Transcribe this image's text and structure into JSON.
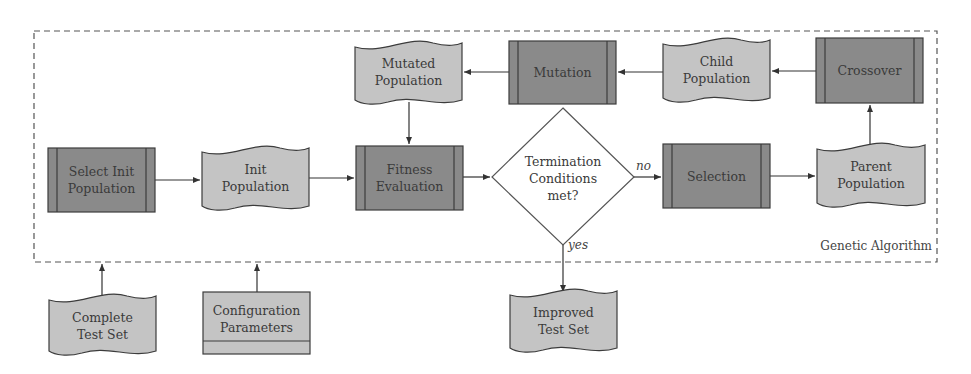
{
  "colors": {
    "process_fill": "#8a8a8a",
    "data_fill": "#c4c4c4",
    "stroke": "#3c3c3c",
    "decision_fill": "#ffffff",
    "dashed_border": "#555555"
  },
  "group": {
    "label": "Genetic Algorithm"
  },
  "nodes": {
    "select_init": {
      "type": "predefined-process",
      "lines": [
        "Select Init",
        "Population"
      ]
    },
    "init_population": {
      "type": "data",
      "lines": [
        "Init",
        "Population"
      ]
    },
    "fitness": {
      "type": "predefined-process",
      "lines": [
        "Fitness",
        "Evaluation"
      ]
    },
    "termination": {
      "type": "decision",
      "lines": [
        "Termination",
        "Conditions",
        "met?"
      ]
    },
    "selection": {
      "type": "predefined-process",
      "lines": [
        "Selection"
      ]
    },
    "parent_population": {
      "type": "data",
      "lines": [
        "Parent",
        "Population"
      ]
    },
    "crossover": {
      "type": "predefined-process",
      "lines": [
        "Crossover"
      ]
    },
    "child_population": {
      "type": "data",
      "lines": [
        "Child",
        "Population"
      ]
    },
    "mutation": {
      "type": "predefined-process",
      "lines": [
        "Mutation"
      ]
    },
    "mutated_population": {
      "type": "data",
      "lines": [
        "Mutated",
        "Population"
      ]
    },
    "complete_test_set": {
      "type": "data",
      "lines": [
        "Complete",
        "Test Set"
      ]
    },
    "config_params": {
      "type": "storage",
      "lines": [
        "Configuration",
        "Parameters"
      ]
    },
    "improved_test_set": {
      "type": "data",
      "lines": [
        "Improved",
        "Test Set"
      ]
    }
  },
  "edges": [
    {
      "from": "select_init",
      "to": "init_population",
      "label": ""
    },
    {
      "from": "init_population",
      "to": "fitness",
      "label": ""
    },
    {
      "from": "fitness",
      "to": "termination",
      "label": ""
    },
    {
      "from": "termination",
      "to": "selection",
      "label": "no"
    },
    {
      "from": "termination",
      "to": "improved_test_set",
      "label": "yes"
    },
    {
      "from": "selection",
      "to": "parent_population",
      "label": ""
    },
    {
      "from": "parent_population",
      "to": "crossover",
      "label": ""
    },
    {
      "from": "crossover",
      "to": "child_population",
      "label": ""
    },
    {
      "from": "child_population",
      "to": "mutation",
      "label": ""
    },
    {
      "from": "mutation",
      "to": "mutated_population",
      "label": ""
    },
    {
      "from": "mutated_population",
      "to": "fitness",
      "label": ""
    },
    {
      "from": "complete_test_set",
      "to": "genetic_algorithm",
      "label": ""
    },
    {
      "from": "config_params",
      "to": "genetic_algorithm",
      "label": ""
    }
  ],
  "edge_labels": {
    "no": "no",
    "yes": "yes"
  }
}
